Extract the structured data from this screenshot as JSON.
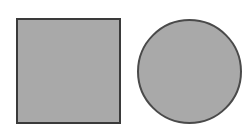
{
  "diagram": {
    "shapes": [
      {
        "type": "square",
        "fill": "#a9a9a9",
        "stroke": "#3a3a3a"
      },
      {
        "type": "circle",
        "fill": "#a9a9a9",
        "stroke": "#4a4a4a"
      }
    ]
  }
}
